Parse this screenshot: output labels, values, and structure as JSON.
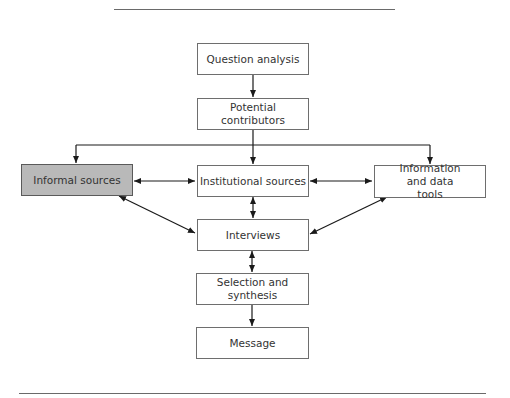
{
  "diagram": {
    "type": "flowchart",
    "highlight_color": "#b9b9b9",
    "nodes": {
      "question_analysis": {
        "label": "Question analysis"
      },
      "potential_contributors": {
        "label": "Potential contributors"
      },
      "informal_sources": {
        "label": "Informal sources",
        "highlighted": true
      },
      "institutional_sources": {
        "label": "Institutional sources"
      },
      "information_data_tools": {
        "label": "Information and data tools"
      },
      "interviews": {
        "label": "Interviews"
      },
      "selection_synthesis": {
        "label": "Selection and synthesis"
      },
      "message": {
        "label": "Message"
      }
    },
    "edges": [
      {
        "from": "question_analysis",
        "to": "potential_contributors",
        "direction": "forward"
      },
      {
        "from": "potential_contributors",
        "to": "informal_sources",
        "direction": "forward"
      },
      {
        "from": "potential_contributors",
        "to": "institutional_sources",
        "direction": "forward"
      },
      {
        "from": "potential_contributors",
        "to": "information_data_tools",
        "direction": "forward"
      },
      {
        "from": "informal_sources",
        "to": "institutional_sources",
        "direction": "both"
      },
      {
        "from": "institutional_sources",
        "to": "information_data_tools",
        "direction": "both"
      },
      {
        "from": "institutional_sources",
        "to": "interviews",
        "direction": "both"
      },
      {
        "from": "informal_sources",
        "to": "interviews",
        "direction": "both"
      },
      {
        "from": "information_data_tools",
        "to": "interviews",
        "direction": "both"
      },
      {
        "from": "interviews",
        "to": "selection_synthesis",
        "direction": "both"
      },
      {
        "from": "selection_synthesis",
        "to": "message",
        "direction": "forward"
      }
    ]
  }
}
